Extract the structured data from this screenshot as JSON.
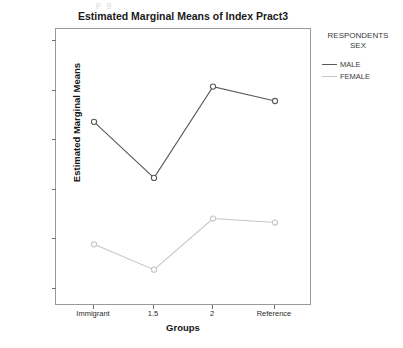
{
  "artifact_text": "p g",
  "chart_data": {
    "type": "line",
    "title": "Estimated Marginal Means of Index Pract3",
    "xlabel": "Groups",
    "ylabel": "Estimated Marginal Means",
    "categories": [
      "Immigrant",
      "1.5",
      "2",
      "Reference"
    ],
    "yticks": [
      "2.90",
      "2.80",
      "2.70",
      "2.60",
      "2.50",
      "2.40"
    ],
    "ylim": [
      2.375,
      2.95
    ],
    "grid": false,
    "legend_position": "right",
    "legend_title_line1": "RESPONDENTS",
    "legend_title_line2": "SEX",
    "series": [
      {
        "name": "MALE",
        "color": "#5a5a5a",
        "values": [
          2.735,
          2.622,
          2.806,
          2.777
        ]
      },
      {
        "name": "FEMALE",
        "color": "#c6c6c6",
        "values": [
          2.488,
          2.437,
          2.54,
          2.532
        ]
      }
    ]
  }
}
